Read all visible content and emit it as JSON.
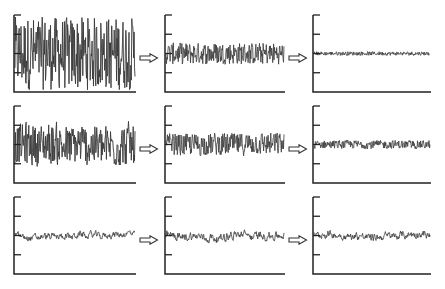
{
  "figure": {
    "signal_color": "#3a3a3a",
    "axis_color": "#222222",
    "arrow_icon": "hollow-right-arrow-icon",
    "rows": [
      {
        "label": "",
        "panels": [
          {
            "id": "r1c1",
            "amplitude": 0.95,
            "smoothness": 0.0,
            "drift": 0.0
          },
          {
            "id": "r1c2",
            "amplitude": 0.28,
            "smoothness": 0.0,
            "drift": 0.0
          },
          {
            "id": "r1c3",
            "amplitude": 0.05,
            "smoothness": 0.0,
            "drift": 0.0
          }
        ]
      },
      {
        "label": "",
        "panels": [
          {
            "id": "r2c1",
            "amplitude": 0.62,
            "smoothness": 0.15,
            "drift": 0.25
          },
          {
            "id": "r2c2",
            "amplitude": 0.32,
            "smoothness": 0.1,
            "drift": 0.1
          },
          {
            "id": "r2c3",
            "amplitude": 0.12,
            "smoothness": 0.1,
            "drift": 0.05
          }
        ]
      },
      {
        "label": "",
        "panels": [
          {
            "id": "r3c1",
            "amplitude": 0.18,
            "smoothness": 0.6,
            "drift": 0.6
          },
          {
            "id": "r3c2",
            "amplitude": 0.2,
            "smoothness": 0.55,
            "drift": 0.55
          },
          {
            "id": "r3c3",
            "amplitude": 0.18,
            "smoothness": 0.55,
            "drift": 0.55
          }
        ]
      }
    ]
  }
}
